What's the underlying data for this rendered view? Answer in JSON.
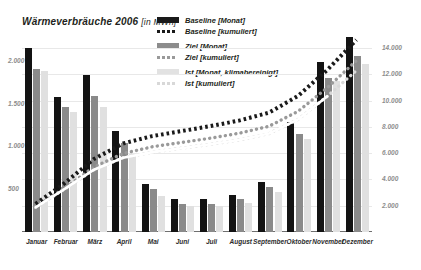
{
  "title": {
    "main": "Wärmeverbräuche 2006",
    "unit": "[in MWh]"
  },
  "legend": {
    "position": "top-center",
    "items": [
      {
        "label": "Baseline [Monat]",
        "style": "solid-bar",
        "color": "#131313",
        "icon": "legend-swatch-dark"
      },
      {
        "label": "Baseline [kumuliert]",
        "style": "dotted-line",
        "color": "#1a1a1a",
        "icon": "legend-dots-dark"
      },
      {
        "label": "Ziel [Monat]",
        "style": "solid-bar",
        "color": "#8a8a8a",
        "icon": "legend-swatch-mid"
      },
      {
        "label": "Ziel [kumuliert]",
        "style": "dotted-line",
        "color": "#9a9a9a",
        "icon": "legend-dots-mid"
      },
      {
        "label": "Ist [Monat, klimabereinigt]",
        "style": "solid-bar",
        "color": "#e0e0e0",
        "icon": "legend-swatch-light"
      },
      {
        "label": "Ist [kumuliert]",
        "style": "dotted-line",
        "color": "#d8d8d8",
        "icon": "legend-dots-light"
      }
    ]
  },
  "chart_data": {
    "type": "bar",
    "title": "Wärmeverbräuche 2006 [in MWh]",
    "xlabel": "",
    "ylabel": "",
    "grid": true,
    "categories": [
      "Januar",
      "Februar",
      "März",
      "April",
      "Mai",
      "Juni",
      "Juli",
      "August",
      "September",
      "Oktober",
      "November",
      "Dezember"
    ],
    "left_axis": {
      "name": "Monatswerte",
      "unit": "MWh",
      "ticks": [
        "500",
        "1.000",
        "1.500",
        "2.000"
      ],
      "tick_values": [
        500,
        1000,
        1500,
        2000
      ],
      "ylim": [
        0,
        2300
      ]
    },
    "right_axis": {
      "name": "Kumuliert",
      "unit": "MWh",
      "ticks": [
        "2.000",
        "4.000",
        "6.000",
        "8.000",
        "10.000",
        "12.000",
        "14.000"
      ],
      "tick_values": [
        2000,
        4000,
        6000,
        8000,
        10000,
        12000,
        14000
      ],
      "ylim": [
        0,
        15000
      ]
    },
    "series": [
      {
        "name": "Baseline [Monat]",
        "axis": "left",
        "type": "bar",
        "color": "#131313",
        "values": [
          2150,
          1580,
          1830,
          1180,
          560,
          385,
          380,
          430,
          585,
          1285,
          1980,
          2280
        ]
      },
      {
        "name": "Ziel [Monat]",
        "axis": "left",
        "type": "bar",
        "color": "#8a8a8a",
        "values": [
          1900,
          1455,
          1590,
          1035,
          505,
          330,
          330,
          385,
          520,
          1140,
          1800,
          2060
        ]
      },
      {
        "name": "Ist [Monat, klimabereinigt]",
        "axis": "left",
        "type": "bar",
        "color": "#e0e0e0",
        "values": [
          1880,
          1400,
          1460,
          915,
          425,
          300,
          300,
          340,
          470,
          1085,
          1760,
          1960
        ]
      },
      {
        "name": "Baseline [kumuliert]",
        "axis": "right",
        "type": "line",
        "style": "dotted",
        "color": "#1a1a1a",
        "values": [
          2150,
          3730,
          5560,
          6740,
          7300,
          7685,
          8065,
          8495,
          9080,
          10365,
          12345,
          14625
        ]
      },
      {
        "name": "Ziel [kumuliert]",
        "axis": "right",
        "type": "line",
        "style": "dotted",
        "color": "#9a9a9a",
        "values": [
          1900,
          3355,
          4945,
          5980,
          6485,
          6815,
          7145,
          7530,
          8050,
          9190,
          10990,
          13050
        ]
      },
      {
        "name": "Ist [kumuliert]",
        "axis": "right",
        "type": "line",
        "style": "dotted-light",
        "color": "#d8d8d8",
        "values": [
          1880,
          3280,
          4740,
          5655,
          6080,
          6380,
          6680,
          7020,
          7490,
          8575,
          10335,
          12295
        ]
      },
      {
        "name": "Ist [kumuliert] (Verlauf)",
        "axis": "right",
        "type": "line",
        "style": "solid-white",
        "color": "#ffffff",
        "values": [
          1880,
          3280,
          4740,
          5655,
          6080,
          6380,
          6680,
          7020,
          7490,
          8575,
          10335,
          null
        ]
      }
    ]
  }
}
